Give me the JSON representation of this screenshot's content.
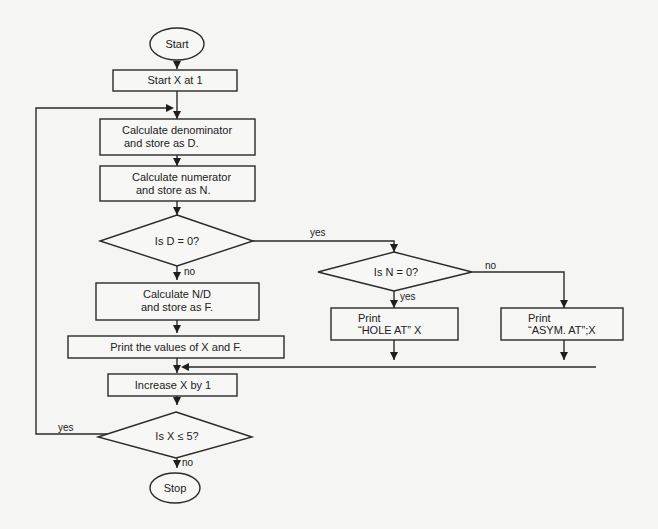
{
  "flowchart": {
    "nodes": {
      "start": {
        "type": "terminal",
        "label": "Start"
      },
      "init": {
        "type": "process",
        "label": "Start X at 1"
      },
      "calc_d": {
        "type": "process",
        "line1": "Calculate denominator",
        "line2": "and store as D."
      },
      "calc_n": {
        "type": "process",
        "line1": "Calculate numerator",
        "line2": "and store as N."
      },
      "is_d_zero": {
        "type": "decision",
        "label": "Is D = 0?"
      },
      "is_n_zero": {
        "type": "decision",
        "label": "Is N = 0?"
      },
      "calc_f": {
        "type": "process",
        "line1": "Calculate N/D",
        "line2": "and store as F."
      },
      "print_xf": {
        "type": "process",
        "label": "Print the values of X and F."
      },
      "print_hole": {
        "type": "process",
        "line1": "Print",
        "line2": "“HOLE AT” X"
      },
      "print_asym": {
        "type": "process",
        "line1": "Print",
        "line2": "“ASYM. AT”;X"
      },
      "increase_x": {
        "type": "process",
        "label": "Increase X by 1"
      },
      "is_x_le_5": {
        "type": "decision",
        "label": "Is X ≤ 5?"
      },
      "stop": {
        "type": "terminal",
        "label": "Stop"
      }
    },
    "edge_labels": {
      "d_zero_yes": "yes",
      "d_zero_no": "no",
      "n_zero_yes": "yes",
      "n_zero_no": "no",
      "x_le_5_yes": "yes",
      "x_le_5_no": "no"
    },
    "colors": {
      "stroke": "#2a2a2a",
      "fill": "#f7f7f5",
      "background": "#f5f5f3"
    }
  }
}
